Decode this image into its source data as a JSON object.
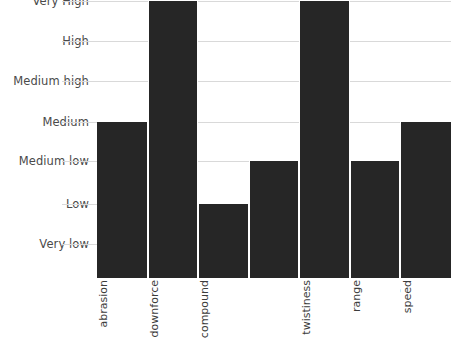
{
  "chart_data": {
    "type": "bar",
    "title": "",
    "subtitle": "",
    "xlabel": "",
    "ylabel": "",
    "grid": true,
    "legend": "none",
    "orientation": "vertical",
    "bar_color": "#262626",
    "grid_color": "#d9d9d9",
    "categories": [
      "Grip level of abrasion",
      "Aerodynamic downforce",
      "Tyre compound",
      "Braking",
      "Level of twistiness",
      "Temperature range",
      "Average speed"
    ],
    "category_lines": [
      "Grip level of\nabrasion",
      "Aerodynamic\ndownforce",
      "Tyre\ncompound",
      "Braking",
      "Level of\ntwistiness",
      "Temperature\nrange",
      "Average\nspeed"
    ],
    "y_categories": [
      "Very low",
      "Low",
      "Medium low",
      "Medium",
      "Medium high",
      "High",
      "Very High"
    ],
    "y_tick_values": [
      1,
      2,
      3,
      4,
      5,
      6,
      7
    ],
    "ylim": [
      0,
      7
    ],
    "values": [
      4,
      7,
      2,
      3,
      7,
      3,
      4
    ],
    "value_labels": [
      "Medium",
      "Very High",
      "Low",
      "Medium low",
      "Very High",
      "Medium low",
      "Medium"
    ]
  },
  "y_axis": {
    "ticks": [
      {
        "label": "Very High",
        "value": 7,
        "y": 1
      },
      {
        "label": "High",
        "value": 6,
        "y": 41
      },
      {
        "label": "Medium high",
        "value": 5,
        "y": 81
      },
      {
        "label": "Medium",
        "value": 4,
        "y": 122
      },
      {
        "label": "Medium low",
        "value": 3,
        "y": 161
      },
      {
        "label": "Low",
        "value": 2,
        "y": 204
      },
      {
        "label": "Very low",
        "value": 1,
        "y": 244
      }
    ]
  }
}
